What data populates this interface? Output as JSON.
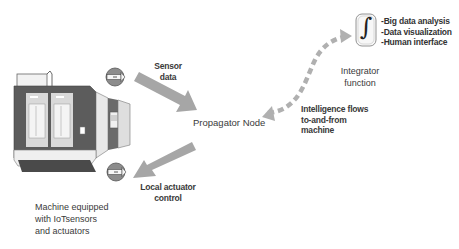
{
  "diagram": {
    "machine": {
      "label_lines": [
        "Machine equipped",
        "with IoTsensors",
        "and actuators"
      ],
      "sensor_icon_top": "sensor-arrow-icon",
      "sensor_icon_bottom": "actuator-arrow-icon"
    },
    "sensor_data": {
      "lines": [
        "Sensor",
        "data"
      ]
    },
    "local_actuator": {
      "lines": [
        "Local actuator",
        "control"
      ]
    },
    "propagator": {
      "label": "Propagator Node"
    },
    "intelligence": {
      "lines": [
        "Intelligence flows",
        "to-and-from",
        "machine"
      ]
    },
    "integrator": {
      "symbol": "∫",
      "label_lines": [
        "Integrator",
        "function"
      ],
      "features": [
        "-Big data analysis",
        "-Data visualization",
        "-Human interface"
      ]
    },
    "colors": {
      "arrow": "#a6a6a6",
      "dashed_arrow": "#b0b0b0",
      "machine_dark": "#5a5a5a",
      "machine_light": "#e6e6e6",
      "icon_fill": "#8c8c8c"
    }
  }
}
